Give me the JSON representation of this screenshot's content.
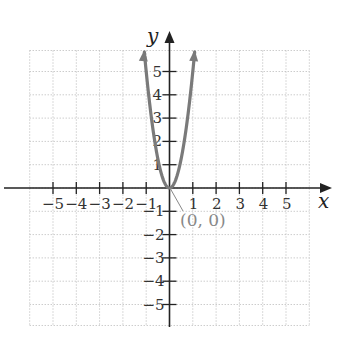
{
  "chart_data": {
    "type": "line",
    "title": "",
    "xlabel": "x",
    "ylabel": "y",
    "xlim": [
      -6,
      6
    ],
    "ylim": [
      -5.9,
      5.9
    ],
    "grid": true,
    "x_ticks": [
      -5,
      -4,
      -3,
      -2,
      -1,
      1,
      2,
      3,
      4,
      5
    ],
    "y_ticks": [
      -5,
      -4,
      -3,
      -2,
      -1,
      1,
      2,
      3,
      4,
      5
    ],
    "series": [
      {
        "name": "parabola",
        "equation": "y = 5x^2",
        "x": [
          -1.08,
          -1,
          -0.8,
          -0.6,
          -0.4,
          -0.2,
          0,
          0.2,
          0.4,
          0.6,
          0.8,
          1,
          1.08
        ],
        "y": [
          5.83,
          5,
          3.2,
          1.8,
          0.8,
          0.2,
          0,
          0.2,
          0.8,
          1.8,
          3.2,
          5,
          5.83
        ],
        "color": "#7a7a7a",
        "arrows_at_ends": true
      }
    ],
    "annotations": [
      {
        "text": "(0, 0)",
        "x": 0,
        "y": 0,
        "type": "vertex-label"
      }
    ]
  },
  "labels": {
    "x_axis": "x",
    "y_axis": "y",
    "vertex": "(0, 0)"
  },
  "colors": {
    "curve": "#7a7a7a",
    "axis": "#222222",
    "grid": "#b5b5b5",
    "label_gray": "#888888"
  }
}
